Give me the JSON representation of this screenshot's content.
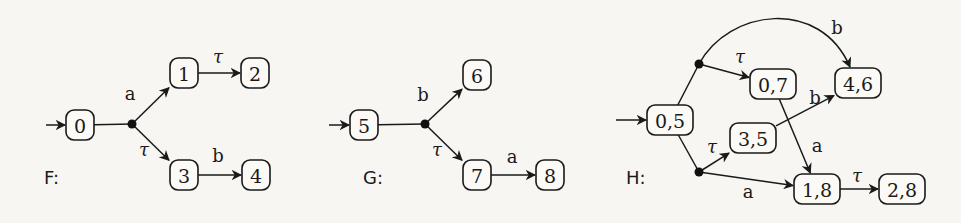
{
  "figure": {
    "graphs": [
      {
        "name": "F",
        "label": "F:",
        "label_pos": [
          44,
          184
        ],
        "initial_arrow": {
          "from": [
            46,
            125
          ],
          "to": "n0"
        },
        "nodes": [
          {
            "id": "n0",
            "label": "0",
            "x": 80,
            "y": 125,
            "w": 28
          },
          {
            "id": "n1",
            "label": "1",
            "x": 184,
            "y": 73,
            "w": 28
          },
          {
            "id": "n2",
            "label": "2",
            "x": 255,
            "y": 73,
            "w": 28
          },
          {
            "id": "n3",
            "label": "3",
            "x": 184,
            "y": 175,
            "w": 28
          },
          {
            "id": "n4",
            "label": "4",
            "x": 256,
            "y": 175,
            "w": 28
          }
        ],
        "branch_points": [
          {
            "id": "d0",
            "x": 132,
            "y": 124
          }
        ],
        "edges": [
          {
            "from": "n0",
            "to": "d0",
            "label": "",
            "arrow": false
          },
          {
            "from": "d0",
            "to": "n1",
            "label": "a",
            "label_pos": [
              130,
              100
            ]
          },
          {
            "from": "d0",
            "to": "n3",
            "label": "τ",
            "label_pos": [
              144,
              156
            ]
          },
          {
            "from": "n1",
            "to": "n2",
            "label": "τ",
            "label_pos": [
              218,
              63
            ]
          },
          {
            "from": "n3",
            "to": "n4",
            "label": "b",
            "label_pos": [
              218,
              162
            ]
          }
        ]
      },
      {
        "name": "G",
        "label": "G:",
        "label_pos": [
          363,
          184
        ],
        "initial_arrow": {
          "from": [
            329,
            125
          ],
          "to": "n5"
        },
        "nodes": [
          {
            "id": "n5",
            "label": "5",
            "x": 364,
            "y": 125,
            "w": 28
          },
          {
            "id": "n6",
            "label": "6",
            "x": 477,
            "y": 75,
            "w": 28
          },
          {
            "id": "n7",
            "label": "7",
            "x": 477,
            "y": 175,
            "w": 28
          },
          {
            "id": "n8",
            "label": "8",
            "x": 550,
            "y": 175,
            "w": 28
          }
        ],
        "branch_points": [
          {
            "id": "d1",
            "x": 425,
            "y": 124
          }
        ],
        "edges": [
          {
            "from": "n5",
            "to": "d1",
            "label": "",
            "arrow": false
          },
          {
            "from": "d1",
            "to": "n6",
            "label": "b",
            "label_pos": [
              423,
              101
            ]
          },
          {
            "from": "d1",
            "to": "n7",
            "label": "τ",
            "label_pos": [
              437,
              156
            ]
          },
          {
            "from": "n7",
            "to": "n8",
            "label": "a",
            "label_pos": [
              512,
              163
            ]
          }
        ]
      },
      {
        "name": "H",
        "label": "H:",
        "label_pos": [
          626,
          184
        ],
        "initial_arrow": {
          "from": [
            616,
            120
          ],
          "to": "h05"
        },
        "nodes": [
          {
            "id": "h05",
            "label": "0,5",
            "x": 670,
            "y": 120,
            "w": 46
          },
          {
            "id": "h07",
            "label": "0,7",
            "x": 773,
            "y": 84,
            "w": 46
          },
          {
            "id": "h46",
            "label": "4,6",
            "x": 858,
            "y": 83,
            "w": 46
          },
          {
            "id": "h35",
            "label": "3,5",
            "x": 753,
            "y": 138,
            "w": 46
          },
          {
            "id": "h18",
            "label": "1,8",
            "x": 817,
            "y": 189,
            "w": 46
          },
          {
            "id": "h28",
            "label": "2,8",
            "x": 902,
            "y": 189,
            "w": 46
          }
        ],
        "branch_points": [
          {
            "id": "d2",
            "x": 699,
            "y": 64
          },
          {
            "id": "d3",
            "x": 699,
            "y": 172
          }
        ],
        "edges": [
          {
            "from": "h05",
            "to": "d2",
            "label": "",
            "arrow": false
          },
          {
            "from": "h05",
            "to": "d3",
            "label": "",
            "arrow": false
          },
          {
            "from": "d2",
            "to": "h07",
            "label": "τ",
            "label_pos": [
              740,
              63
            ]
          },
          {
            "from": "d2",
            "to": "h46",
            "label": "b",
            "label_pos": [
              837,
              34
            ],
            "curved": true
          },
          {
            "from": "h35",
            "to": "h46",
            "label": "b",
            "label_pos": [
              815,
              104
            ]
          },
          {
            "from": "h07",
            "to": "h18",
            "label": "a",
            "label_pos": [
              817,
              152
            ]
          },
          {
            "from": "d3",
            "to": "h35",
            "label": "τ",
            "label_pos": [
              712,
              153
            ]
          },
          {
            "from": "d3",
            "to": "h18",
            "label": "a",
            "label_pos": [
              748,
              198
            ]
          },
          {
            "from": "h18",
            "to": "h28",
            "label": "τ",
            "label_pos": [
              857,
              182
            ]
          }
        ]
      }
    ]
  }
}
